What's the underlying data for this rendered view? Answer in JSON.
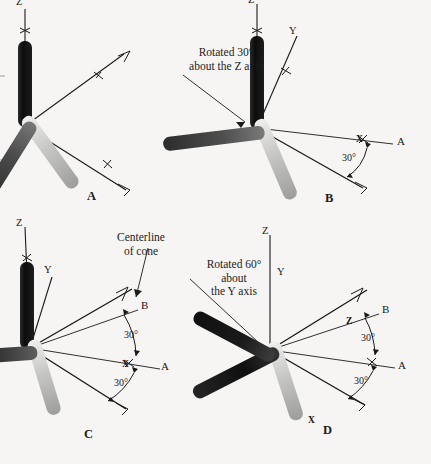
{
  "figure": {
    "background_color": "#f6f5f3",
    "ink_color": "#1a1a1a",
    "rod_colors": {
      "z_axis_rod": "#111111",
      "y_axis_rod": "#c9c9c7",
      "x_axis_rod": "#565656"
    }
  },
  "panels": {
    "a": {
      "label": "A",
      "axis_labels": {
        "z": "Z",
        "y": "Y",
        "x": "X"
      }
    },
    "b": {
      "label": "B",
      "note": "Rotated 30°\nabout the Z axis",
      "axis_labels": {
        "z": "Z",
        "y": "Y",
        "x": "X"
      },
      "ray_labels": {
        "a": "A"
      },
      "angles": {
        "x_to_a": "30°"
      }
    },
    "c": {
      "label": "C",
      "note": "Centerline\nof cone",
      "axis_labels": {
        "z": "Z",
        "y": "Y",
        "x": "X"
      },
      "ray_labels": {
        "a": "A",
        "b": "B"
      },
      "angles": {
        "b_to_a": "30°",
        "a_to_x": "30°"
      }
    },
    "d": {
      "label": "D",
      "note": "Rotated 60°\nabout\nthe Y axis",
      "axis_labels": {
        "z": "Z",
        "y": "Y",
        "x": "X"
      },
      "ray_labels": {
        "a": "A",
        "b": "B"
      },
      "angles": {
        "b_to_a": "30°",
        "a_to_x": "30°"
      }
    }
  }
}
